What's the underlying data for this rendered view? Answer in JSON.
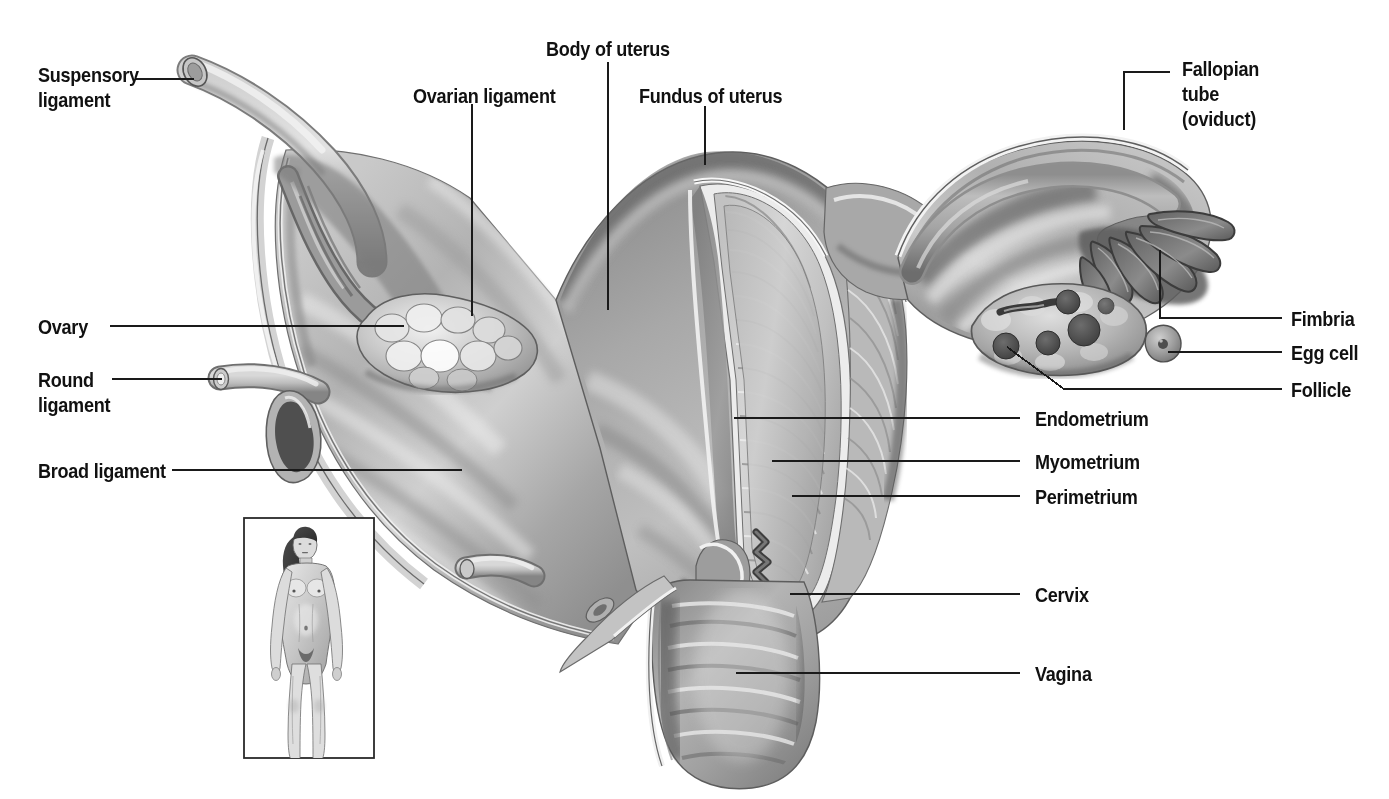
{
  "figure": {
    "style": "grayscale medical illustration with leader-line callouts"
  },
  "labels": {
    "suspensory_ligament": "Suspensory\nligament",
    "ovarian_ligament": "Ovarian ligament",
    "body_of_uterus": "Body of uterus",
    "fundus_of_uterus": "Fundus of uterus",
    "fallopian_tube": "Fallopian\ntube\n(oviduct)",
    "fimbria": "Fimbria",
    "egg_cell": "Egg cell",
    "follicle": "Follicle",
    "endometrium": "Endometrium",
    "myometrium": "Myometrium",
    "perimetrium": "Perimetrium",
    "cervix": "Cervix",
    "vagina": "Vagina",
    "ovary": "Ovary",
    "round_ligament": "Round\nligament",
    "broad_ligament": "Broad ligament"
  },
  "inset": {
    "name": "whole-body-female-figure",
    "description": "standing female body orientation inset"
  },
  "colors": {
    "text": "#111111",
    "leader_line": "#1a1a1a",
    "background": "#ffffff",
    "tissue_light": "#d8d8d8",
    "tissue_mid": "#a9a9a9",
    "tissue_dark": "#6f6f6f",
    "tissue_shadow": "#4a4a4a",
    "highlight": "#efefef"
  }
}
